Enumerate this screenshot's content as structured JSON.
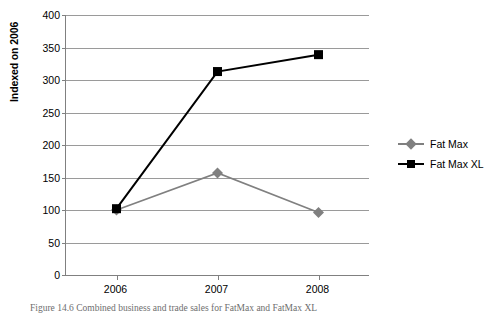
{
  "chart_data": {
    "type": "line",
    "title": "",
    "xlabel": "",
    "ylabel": "Indexed on 2006",
    "categories": [
      "2006",
      "2007",
      "2008"
    ],
    "ylim": [
      0,
      400
    ],
    "yticks": [
      0,
      50,
      100,
      150,
      200,
      250,
      300,
      350,
      400
    ],
    "ytick_labels": [
      "0",
      "50",
      "100",
      "150",
      "200",
      "250",
      "300",
      "350",
      "400"
    ],
    "grid": true,
    "legend_position": "right",
    "series": [
      {
        "name": "Fat Max",
        "values": [
          100,
          157,
          96
        ],
        "color": "#808080",
        "marker": "diamond"
      },
      {
        "name": "Fat Max XL",
        "values": [
          102,
          313,
          339
        ],
        "color": "#000000",
        "marker": "square"
      }
    ]
  },
  "legend": {
    "items": [
      {
        "label": "Fat Max"
      },
      {
        "label": "Fat Max XL"
      }
    ]
  },
  "caption": {
    "text": "Figure 14.6  Combined business and trade sales for FatMax and FatMax XL"
  },
  "colors": {
    "gridline": "#9a9a9a",
    "axis": "#808080",
    "series_1": "#808080",
    "series_2": "#000000",
    "background": "#ffffff"
  }
}
